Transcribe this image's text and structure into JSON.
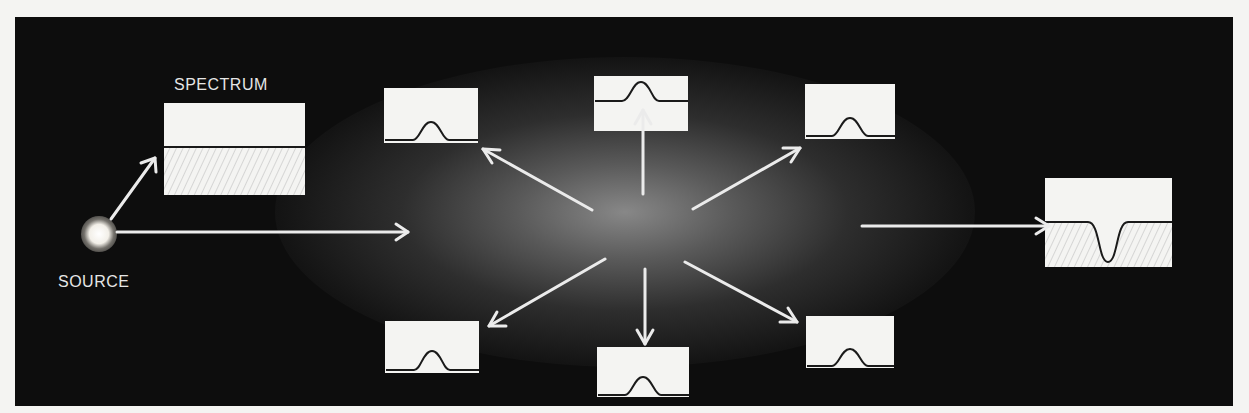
{
  "diagram": {
    "source_label": "SOURCE",
    "spectrum_label": "SPECTRUM",
    "colors": {
      "panel_background": "#0d0d0d",
      "arrow": "#ebebeb",
      "box_fill": "#f4f4f2",
      "curve": "#1a1a1a",
      "hatch": "#b8b8b8"
    },
    "nodes": [
      {
        "id": "source",
        "type": "light-source",
        "label": "SOURCE"
      },
      {
        "id": "continuous-spectrum",
        "type": "spectrum-box",
        "label": "SPECTRUM",
        "profile": "flat-continuum",
        "hatched_below": true
      },
      {
        "id": "gas-cloud",
        "type": "glowing-cloud"
      },
      {
        "id": "emission-upper-left",
        "type": "spectrum-box",
        "profile": "emission-peak"
      },
      {
        "id": "emission-top",
        "type": "spectrum-box",
        "profile": "emission-peak"
      },
      {
        "id": "emission-upper-right",
        "type": "spectrum-box",
        "profile": "emission-peak"
      },
      {
        "id": "emission-lower-left",
        "type": "spectrum-box",
        "profile": "emission-peak"
      },
      {
        "id": "emission-bottom",
        "type": "spectrum-box",
        "profile": "emission-peak"
      },
      {
        "id": "emission-lower-right",
        "type": "spectrum-box",
        "profile": "emission-peak"
      },
      {
        "id": "absorption-spectrum",
        "type": "spectrum-box",
        "profile": "absorption-dip",
        "hatched_below": true
      }
    ],
    "edges": [
      {
        "from": "source",
        "to": "continuous-spectrum"
      },
      {
        "from": "source",
        "to": "gas-cloud"
      },
      {
        "from": "gas-cloud",
        "to": "emission-upper-left"
      },
      {
        "from": "gas-cloud",
        "to": "emission-top"
      },
      {
        "from": "gas-cloud",
        "to": "emission-upper-right"
      },
      {
        "from": "gas-cloud",
        "to": "emission-lower-left"
      },
      {
        "from": "gas-cloud",
        "to": "emission-bottom"
      },
      {
        "from": "gas-cloud",
        "to": "emission-lower-right"
      },
      {
        "from": "gas-cloud",
        "to": "absorption-spectrum"
      }
    ]
  }
}
